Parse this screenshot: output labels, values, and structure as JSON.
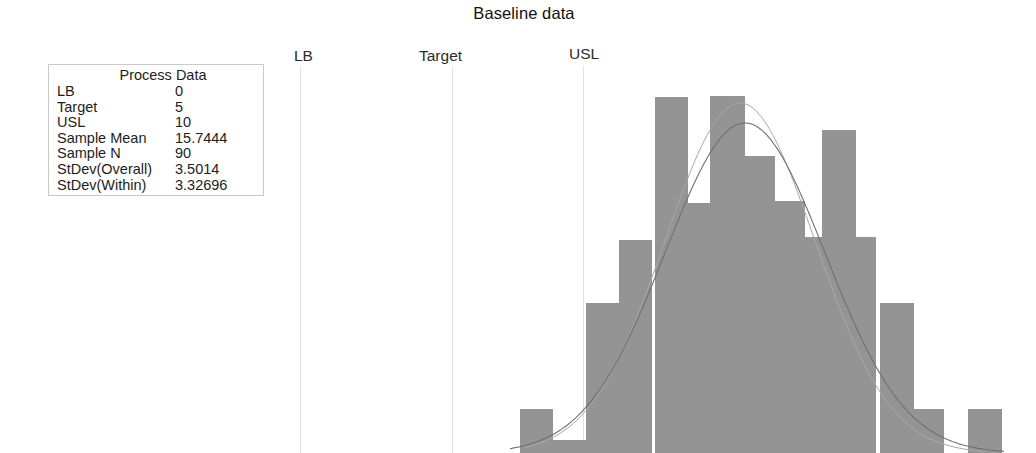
{
  "chart": {
    "title": "Baseline data"
  },
  "spec_labels": {
    "lb": "LB",
    "target": "Target",
    "usl": "USL"
  },
  "process_data": {
    "heading": "Process Data",
    "rows": [
      {
        "label": "LB",
        "value": "0"
      },
      {
        "label": "Target",
        "value": "5"
      },
      {
        "label": "USL",
        "value": "10"
      },
      {
        "label": "Sample Mean",
        "value": "15.7444"
      },
      {
        "label": "Sample N",
        "value": "90"
      },
      {
        "label": "StDev(Overall)",
        "value": "3.5014"
      },
      {
        "label": "StDev(Within)",
        "value": "3.32696"
      }
    ]
  },
  "colors": {
    "bar_fill": "#949494",
    "curve_within": "#707070",
    "curve_overall": "#a8a8a8",
    "spec_rule": "#e2e2e2",
    "text": "#1a1a1a"
  },
  "chart_data": {
    "type": "bar",
    "title": "Baseline data",
    "xlabel": "",
    "ylabel": "",
    "grid": false,
    "legend_position": "none",
    "note": "Process capability histogram with fitted Within and Overall normal curves. Plot is cropped at the bottom of the image; bar heights given as pixel tops in image coordinates (y increases downward, baseline y=453).",
    "baseline_y": 453,
    "bar_width_px": 33,
    "categories": [
      "bin1",
      "bin2",
      "bin3",
      "bin4",
      "bin5",
      "bin6",
      "bin7",
      "bin8",
      "bin9",
      "bin10",
      "bin11",
      "bin12",
      "bin13",
      "bin14"
    ],
    "bars": [
      {
        "bin": "bin1",
        "x_left": 520,
        "x_right": 553,
        "top_y": 409,
        "height_px": 44
      },
      {
        "bin": "bin2",
        "x_left": 553,
        "x_right": 586,
        "top_y": 440,
        "height_px": 13
      },
      {
        "bin": "bin3",
        "x_left": 586,
        "x_right": 619,
        "top_y": 303,
        "height_px": 150
      },
      {
        "bin": "bin4",
        "x_left": 619,
        "x_right": 652,
        "top_y": 240,
        "height_px": 213
      },
      {
        "bin": "bin5",
        "x_left": 655,
        "x_right": 688,
        "top_y": 97,
        "height_px": 356
      },
      {
        "bin": "bin6",
        "x_left": 688,
        "x_right": 710,
        "top_y": 203,
        "height_px": 250
      },
      {
        "bin": "bin7",
        "x_left": 710,
        "x_right": 745,
        "top_y": 96,
        "height_px": 357
      },
      {
        "bin": "bin8",
        "x_left": 745,
        "x_right": 775,
        "top_y": 156,
        "height_px": 297
      },
      {
        "bin": "bin9",
        "x_left": 775,
        "x_right": 805,
        "top_y": 201,
        "height_px": 252
      },
      {
        "bin": "bin10",
        "x_left": 805,
        "x_right": 822,
        "top_y": 237,
        "height_px": 216
      },
      {
        "bin": "bin11",
        "x_left": 822,
        "x_right": 856,
        "top_y": 130,
        "height_px": 323
      },
      {
        "bin": "bin12",
        "x_left": 856,
        "x_right": 876,
        "top_y": 237,
        "height_px": 216
      },
      {
        "bin": "bin13",
        "x_left": 880,
        "x_right": 914,
        "top_y": 303,
        "height_px": 150
      },
      {
        "bin": "bin14",
        "x_left": 914,
        "x_right": 944,
        "top_y": 409,
        "height_px": 44
      },
      {
        "bin": "bin15",
        "x_left": 968,
        "x_right": 1002,
        "top_y": 409,
        "height_px": 44
      }
    ],
    "curves": [
      {
        "name": "Overall",
        "style": "thin-light",
        "peak_x": 740,
        "peak_y": 103,
        "left_foot_x": 545,
        "right_foot_x": 965
      },
      {
        "name": "Within",
        "style": "thin-dark",
        "peak_x": 745,
        "peak_y": 123,
        "left_foot_x": 530,
        "right_foot_x": 985
      }
    ],
    "spec_lines": [
      {
        "label": "LB",
        "x": 300
      },
      {
        "label": "Target",
        "x": 452
      },
      {
        "label": "USL",
        "x": 583
      }
    ]
  }
}
